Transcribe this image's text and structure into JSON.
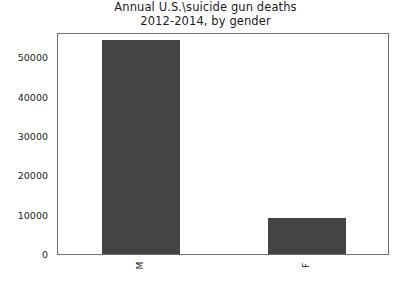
{
  "chart_data": {
    "type": "bar",
    "title": "Annual U.S.\\suicide gun deaths\n2012-2014, by gender",
    "title_lines": [
      "Annual U.S.\\suicide gun deaths",
      "2012-2014, by gender"
    ],
    "categories": [
      "M",
      "F"
    ],
    "values": [
      54300,
      9200
    ],
    "series": [
      {
        "name": "Annual suicide gun deaths",
        "values": [
          54300,
          9200
        ]
      }
    ],
    "xlabel": "",
    "ylabel": "",
    "ylim": [
      0,
      56400
    ],
    "xtick_labels": [
      "M",
      "F"
    ],
    "xtick_rotation": -90,
    "ytick_labels": [
      "0",
      "10000",
      "20000",
      "30000",
      "40000",
      "50000"
    ],
    "ytick_values": [
      0,
      10000,
      20000,
      30000,
      40000,
      50000
    ],
    "grid": false,
    "legend": false,
    "legend_position": "none",
    "bar_color": "#444444",
    "frame_color": "#6e6e6e",
    "background_color": "#ffffff",
    "text_color": "#1c1c1c"
  }
}
